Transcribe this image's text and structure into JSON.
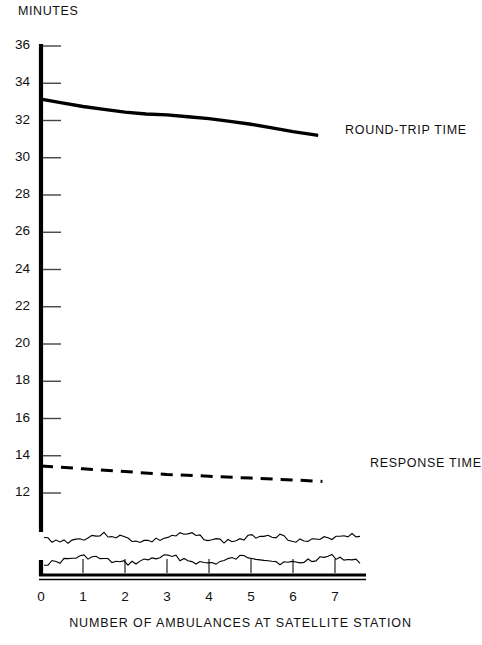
{
  "chart_data": {
    "type": "line",
    "title": "",
    "ylabel": "MINUTES",
    "xlabel": "NUMBER OF AMBULANCES AT SATELLITE STATION",
    "xlim": [
      0,
      7.8
    ],
    "ylim": [
      11.2,
      36
    ],
    "xticks": [
      0,
      1,
      2,
      3,
      4,
      5,
      6,
      7
    ],
    "xtick_labels": [
      "0",
      "1",
      "2",
      "3",
      "4",
      "5",
      "6",
      "7"
    ],
    "yticks": [
      12,
      14,
      16,
      18,
      20,
      22,
      24,
      26,
      28,
      30,
      32,
      34,
      36
    ],
    "ytick_labels": [
      "12",
      "14",
      "16",
      "18",
      "20",
      "22",
      "24",
      "26",
      "28",
      "30",
      "32",
      "34",
      "36"
    ],
    "y_axis_break": true,
    "grid": false,
    "legend": "inline-right",
    "series": [
      {
        "name": "ROUND-TRIP TIME",
        "style": "solid",
        "color": "#000000",
        "width": 3.4,
        "label_x": 345,
        "label_y": 131,
        "x": [
          0,
          0.5,
          1,
          1.5,
          2,
          2.5,
          3,
          3.5,
          4,
          4.5,
          5,
          5.5,
          6,
          6.6
        ],
        "y": [
          33.15,
          32.95,
          32.75,
          32.6,
          32.45,
          32.35,
          32.3,
          32.2,
          32.1,
          31.95,
          31.8,
          31.6,
          31.4,
          31.2
        ]
      },
      {
        "name": "RESPONSE TIME",
        "style": "dashed",
        "color": "#000000",
        "width": 3.0,
        "label_x": 370,
        "label_y": 464,
        "x": [
          0,
          1,
          2,
          3,
          4,
          5,
          6,
          6.7
        ],
        "y": [
          13.45,
          13.3,
          13.15,
          13.0,
          12.9,
          12.8,
          12.7,
          12.62
        ]
      }
    ],
    "axis_notes": {
      "y_axis_color": "#000000",
      "x_axis_color": "#000000",
      "break_marker": "wavy-double-line"
    }
  },
  "labels": {
    "y_title": "MINUTES",
    "x_title": "NUMBER OF AMBULANCES AT SATELLITE STATION",
    "round_trip": "ROUND-TRIP TIME",
    "response": "RESPONSE TIME"
  }
}
